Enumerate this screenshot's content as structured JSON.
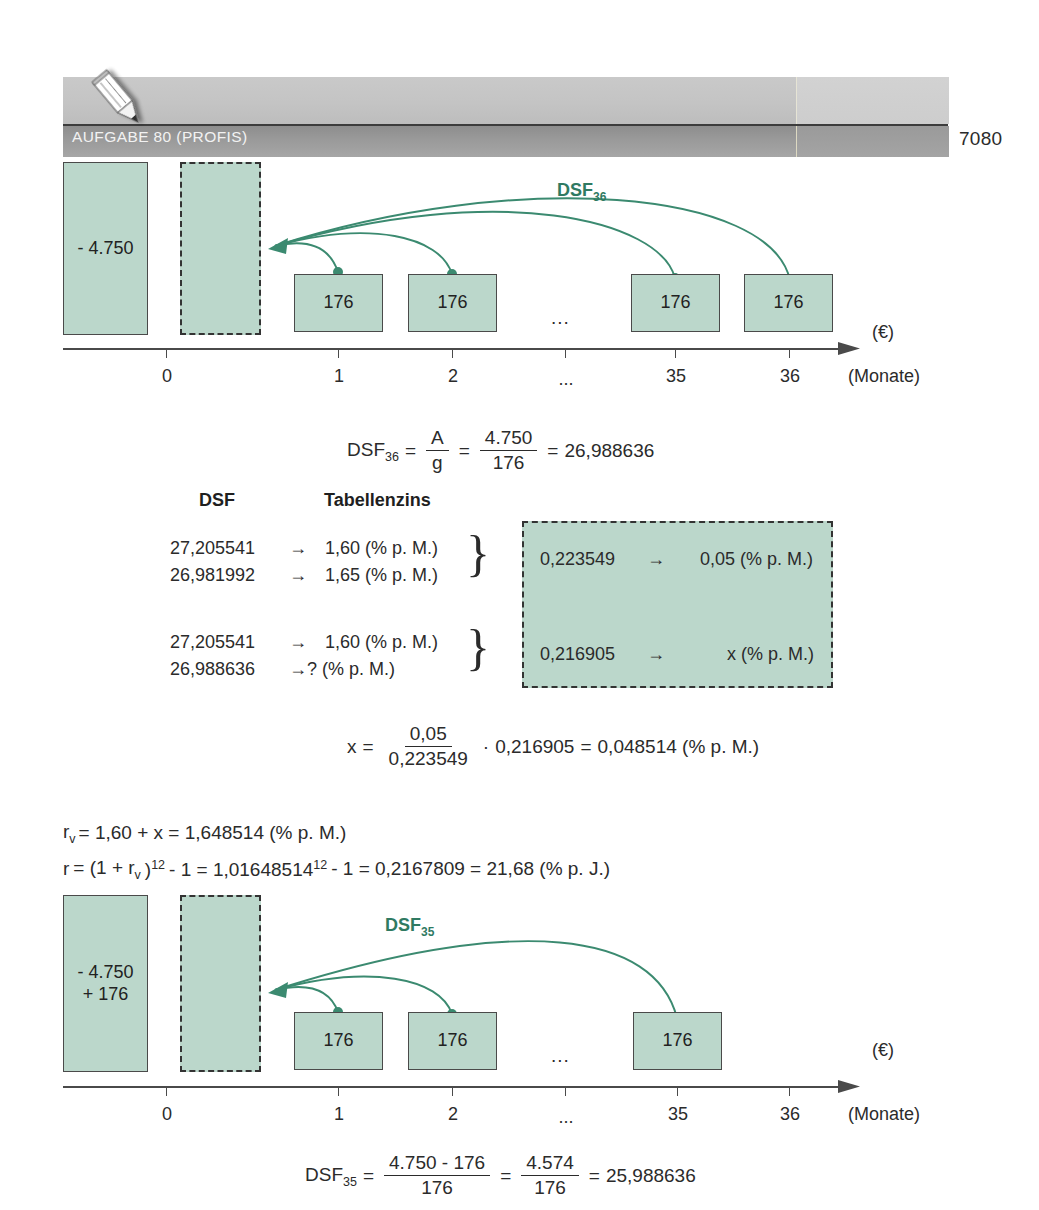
{
  "header": {
    "title": "AUFGABE 80 (PROFIS)",
    "page_number": "7080",
    "pencil_icon": "pencil-icon"
  },
  "diagram1": {
    "dsf_label": "DSF",
    "dsf_sub": "36",
    "bars": [
      {
        "id": "outflow",
        "lines": [
          "- 4.750"
        ]
      },
      {
        "id": "discounted",
        "lines": []
      },
      {
        "id": "m1",
        "lines": [
          "176"
        ]
      },
      {
        "id": "m2",
        "lines": [
          "176"
        ]
      },
      {
        "id": "m35",
        "lines": [
          "176"
        ]
      },
      {
        "id": "m36",
        "lines": [
          "176"
        ]
      }
    ],
    "gap_marker": "...",
    "ticks": [
      "0",
      "1",
      "2",
      "...",
      "35",
      "36"
    ],
    "value_axis_unit": "(€)",
    "time_axis_unit": "(Monate)"
  },
  "formula_dsf36": {
    "lhs": "DSF",
    "lhs_sub": "36",
    "eq1": "=",
    "frac1_num": "A",
    "frac1_den": "g",
    "eq2": "=",
    "frac2_num": "4.750",
    "frac2_den": "176",
    "eq3": "=",
    "result": "26,988636"
  },
  "interpolation_table": {
    "col1_header": "DSF",
    "col2_header": "Tabellenzins",
    "arrow": "→",
    "group1": [
      {
        "dsf": "27,205541",
        "zins": "1,60 (% p. M.)"
      },
      {
        "dsf": "26,981992",
        "zins": "1,65 (% p. M.)"
      }
    ],
    "group2": [
      {
        "dsf": "27,205541",
        "zins": "1,60 (% p. M.)"
      },
      {
        "dsf": "26,988636",
        "zins": "? (% p. M.)"
      }
    ],
    "brace": "}"
  },
  "difference_box": {
    "rows": [
      {
        "diff": "0,223549",
        "arrow": "→",
        "zins": "0,05 (% p. M.)"
      },
      {
        "diff": "0,216905",
        "arrow": "→",
        "zins": "x (% p. M.)"
      }
    ]
  },
  "formula_x": {
    "lhs": "x",
    "eq1": "=",
    "frac_num": "0,05",
    "frac_den": "0,223549",
    "dot": "·",
    "factor": "0,216905",
    "eq2": "=",
    "result": "0,048514 (% p. M.)"
  },
  "formula_rv": {
    "lhs": "r",
    "lhs_sub": "v",
    "text": "= 1,60 + x = 1,648514 (% p. M.)"
  },
  "formula_r": {
    "lhs": "r",
    "p1": "= (1 + r",
    "p1_sub": "v",
    "p2": ")",
    "p2_sup": "12",
    "p3": "- 1 = 1,01648514",
    "p3_sup": "12",
    "p4": "- 1 = 0,2167809 = 21,68 (% p. J.)"
  },
  "diagram2": {
    "dsf_label": "DSF",
    "dsf_sub": "35",
    "bars": [
      {
        "id": "outflow",
        "lines": [
          "- 4.750",
          "+ 176"
        ]
      },
      {
        "id": "discounted",
        "lines": []
      },
      {
        "id": "m1",
        "lines": [
          "176"
        ]
      },
      {
        "id": "m2",
        "lines": [
          "176"
        ]
      },
      {
        "id": "m35",
        "lines": [
          "176"
        ]
      }
    ],
    "gap_marker": "...",
    "ticks": [
      "0",
      "1",
      "2",
      "...",
      "35",
      "36"
    ],
    "value_axis_unit": "(€)",
    "time_axis_unit": "(Monate)"
  },
  "formula_dsf35": {
    "lhs": "DSF",
    "lhs_sub": "35",
    "eq1": "=",
    "frac1_num": "4.750 - 176",
    "frac1_den": "176",
    "eq2": "=",
    "frac2_num": "4.574",
    "frac2_den": "176",
    "eq3": "=",
    "result": "25,988636"
  },
  "colors": {
    "green_fill": "#bbd7cb",
    "green_accent": "#2f7a62",
    "header_dark": "#999999",
    "header_light": "#c6c6c6",
    "text": "#2b2b2b"
  }
}
